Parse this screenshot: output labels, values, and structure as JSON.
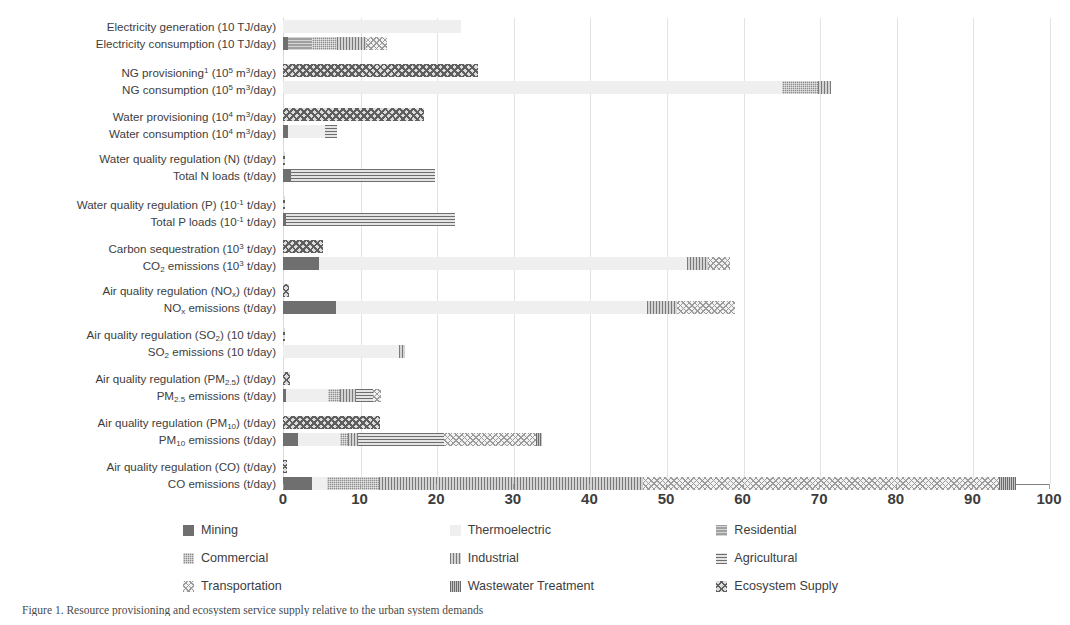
{
  "chart_data": {
    "type": "bar",
    "orientation": "horizontal",
    "title": "",
    "xlabel": "",
    "ylabel": "",
    "xlim": [
      0,
      100
    ],
    "xticks": [
      0,
      10,
      20,
      30,
      40,
      50,
      60,
      70,
      80,
      90,
      100
    ],
    "grid": true,
    "stacked": true,
    "legend_position": "bottom",
    "series": [
      {
        "name": "Mining",
        "pattern": "solid-dark",
        "color": "#6f6f6f"
      },
      {
        "name": "Thermoelectric",
        "pattern": "solid-light",
        "color": "#efefef"
      },
      {
        "name": "Residential",
        "pattern": "horizontal-fine",
        "color": "#a0a0a0"
      },
      {
        "name": "Commercial",
        "pattern": "grid-fine",
        "color": "#8e8e8e"
      },
      {
        "name": "Industrial",
        "pattern": "vertical-lines",
        "color": "#d3d3d3"
      },
      {
        "name": "Agricultural",
        "pattern": "horizontal-lines",
        "color": "#e4e4e4"
      },
      {
        "name": "Transportation",
        "pattern": "diagonal-cross-light",
        "color": "#f2f2f2"
      },
      {
        "name": "Wastewater Treatment",
        "pattern": "vertical-dense",
        "color": "#c6c6c6"
      },
      {
        "name": "Ecosystem Supply",
        "pattern": "diamond-cross",
        "color": "#dcdcdc"
      }
    ],
    "groups": [
      {
        "rows": [
          {
            "label_html": "Electricity generation (10 TJ/day)",
            "label_text": "Electricity generation (10 TJ/day)",
            "total": 23.2,
            "segments": [
              {
                "series": "Thermoelectric",
                "value": 23.2
              }
            ]
          },
          {
            "label_html": "Electricity consumption (10 TJ/day)",
            "label_text": "Electricity consumption (10 TJ/day)",
            "total": 13.6,
            "segments": [
              {
                "series": "Mining",
                "value": 0.7
              },
              {
                "series": "Residential",
                "value": 3.1
              },
              {
                "series": "Commercial",
                "value": 3.3
              },
              {
                "series": "Industrial",
                "value": 3.8
              },
              {
                "series": "Transportation",
                "value": 2.7
              }
            ]
          }
        ]
      },
      {
        "rows": [
          {
            "label_html": "NG provisioning<sup>1</sup> (10<sup>5</sup> m<sup>3</sup>/day)",
            "label_text": "NG provisioning1 (10^5 m3/day)",
            "total": 25.5,
            "segments": [
              {
                "series": "Ecosystem Supply",
                "value": 25.5
              }
            ]
          },
          {
            "label_html": "NG consumption (10<sup>5</sup> m<sup>3</sup>/day)",
            "label_text": "NG consumption (10^5 m3/day)",
            "total": 71.6,
            "segments": [
              {
                "series": "Thermoelectric",
                "value": 65.1
              },
              {
                "series": "Commercial",
                "value": 4.7
              },
              {
                "series": "Industrial",
                "value": 1.8
              }
            ]
          }
        ]
      },
      {
        "rows": [
          {
            "label_html": "Water provisioning (10<sup>4</sup> m<sup>3</sup>/day)",
            "label_text": "Water provisioning (10^4 m3/day)",
            "total": 18.4,
            "segments": [
              {
                "series": "Ecosystem Supply",
                "value": 18.4
              }
            ]
          },
          {
            "label_html": "Water consumption (10<sup>4</sup> m<sup>3</sup>/day)",
            "label_text": "Water consumption (10^4 m3/day)",
            "total": 7.0,
            "segments": [
              {
                "series": "Mining",
                "value": 0.6
              },
              {
                "series": "Thermoelectric",
                "value": 4.9
              },
              {
                "series": "Agricultural",
                "value": 1.5
              }
            ]
          }
        ]
      },
      {
        "rows": [
          {
            "label_html": "Water quality regulation (N) (t/day)",
            "label_text": "Water quality regulation (N) (t/day)",
            "total": 0.25,
            "segments": [
              {
                "series": "Ecosystem Supply",
                "value": 0.25
              }
            ]
          },
          {
            "label_html": "Total N loads (t/day)",
            "label_text": "Total N loads (t/day)",
            "total": 19.8,
            "segments": [
              {
                "series": "Mining",
                "value": 1.0
              },
              {
                "series": "Agricultural",
                "value": 18.8
              }
            ]
          }
        ]
      },
      {
        "rows": [
          {
            "label_html": "Water quality regulation (P) (10<sup>-1</sup> t/day)",
            "label_text": "Water quality regulation (P) (10^-1 t/day)",
            "total": 0.25,
            "segments": [
              {
                "series": "Ecosystem Supply",
                "value": 0.25
              }
            ]
          },
          {
            "label_html": "Total P loads (10<sup>-1</sup> t/day)",
            "label_text": "Total P loads (10^-1 t/day)",
            "total": 22.5,
            "segments": [
              {
                "series": "Mining",
                "value": 0.4
              },
              {
                "series": "Agricultural",
                "value": 22.1
              }
            ]
          }
        ]
      },
      {
        "rows": [
          {
            "label_html": "Carbon sequestration (10<sup>3</sup> t/day)",
            "label_text": "Carbon sequestration (10^3 t/day)",
            "total": 5.2,
            "segments": [
              {
                "series": "Ecosystem Supply",
                "value": 5.2
              }
            ]
          },
          {
            "label_html": "CO<sub>2</sub> emissions (10<sup>3</sup> t/day)",
            "label_text": "CO2 emissions (10^3 t/day)",
            "total": 58.3,
            "segments": [
              {
                "series": "Mining",
                "value": 4.7
              },
              {
                "series": "Thermoelectric",
                "value": 48.0
              },
              {
                "series": "Industrial",
                "value": 2.8
              },
              {
                "series": "Transportation",
                "value": 2.8
              }
            ]
          }
        ]
      },
      {
        "rows": [
          {
            "label_html": "Air quality regulation (NO<sub>x</sub>) (t/day)",
            "label_text": "Air quality regulation (NOx) (t/day)",
            "total": 0.8,
            "segments": [
              {
                "series": "Ecosystem Supply",
                "value": 0.8
              }
            ]
          },
          {
            "label_html": "NO<sub>x</sub> emissions (t/day)",
            "label_text": "NOx emissions (t/day)",
            "total": 59.0,
            "segments": [
              {
                "series": "Mining",
                "value": 6.9
              },
              {
                "series": "Thermoelectric",
                "value": 40.6
              },
              {
                "series": "Industrial",
                "value": 4.0
              },
              {
                "series": "Transportation",
                "value": 7.5
              }
            ]
          }
        ]
      },
      {
        "rows": [
          {
            "label_html": "Air quality regulation (SO<sub>2</sub>) (10 t/day)",
            "label_text": "Air quality regulation (SO2) (10 t/day)",
            "total": 0.3,
            "segments": [
              {
                "series": "Ecosystem Supply",
                "value": 0.3
              }
            ]
          },
          {
            "label_html": "SO<sub>2</sub> emissions (10 t/day)",
            "label_text": "SO2 emissions (10 t/day)",
            "total": 15.9,
            "segments": [
              {
                "series": "Thermoelectric",
                "value": 15.2
              },
              {
                "series": "Industrial",
                "value": 0.7
              }
            ]
          }
        ]
      },
      {
        "rows": [
          {
            "label_html": "Air quality regulation (PM<sub>2.5</sub>) (t/day)",
            "label_text": "Air quality regulation (PM2.5) (t/day)",
            "total": 0.9,
            "segments": [
              {
                "series": "Ecosystem Supply",
                "value": 0.9
              }
            ]
          },
          {
            "label_html": "PM<sub>2.5</sub> emissions (t/day)",
            "label_text": "PM2.5 emissions (t/day)",
            "total": 12.8,
            "segments": [
              {
                "series": "Mining",
                "value": 0.4
              },
              {
                "series": "Thermoelectric",
                "value": 5.5
              },
              {
                "series": "Commercial",
                "value": 1.5
              },
              {
                "series": "Industrial",
                "value": 2.1
              },
              {
                "series": "Agricultural",
                "value": 2.3
              },
              {
                "series": "Transportation",
                "value": 1.0
              }
            ]
          }
        ]
      },
      {
        "rows": [
          {
            "label_html": "Air quality regulation (PM<sub>10</sub>) (t/day)",
            "label_text": "Air quality regulation (PM10) (t/day)",
            "total": 12.7,
            "segments": [
              {
                "series": "Ecosystem Supply",
                "value": 12.7
              }
            ]
          },
          {
            "label_html": "PM<sub>10</sub> emissions (t/day)",
            "label_text": "PM10 emissions (t/day)",
            "total": 33.8,
            "segments": [
              {
                "series": "Mining",
                "value": 1.9
              },
              {
                "series": "Thermoelectric",
                "value": 5.6
              },
              {
                "series": "Commercial",
                "value": 1.0
              },
              {
                "series": "Industrial",
                "value": 1.3
              },
              {
                "series": "Agricultural",
                "value": 11.2
              },
              {
                "series": "Transportation",
                "value": 12.0
              },
              {
                "series": "Wastewater Treatment",
                "value": 0.8
              }
            ]
          }
        ]
      },
      {
        "rows": [
          {
            "label_html": "Air quality regulation (CO) (t/day)",
            "label_text": "Air quality regulation (CO) (t/day)",
            "total": 0.5,
            "segments": [
              {
                "series": "Ecosystem Supply",
                "value": 0.5
              }
            ]
          },
          {
            "label_html": "CO emissions (t/day)",
            "label_text": "CO emissions (t/day)",
            "total": 95.7,
            "segments": [
              {
                "series": "Mining",
                "value": 3.8
              },
              {
                "series": "Thermoelectric",
                "value": 2.0
              },
              {
                "series": "Commercial",
                "value": 6.7
              },
              {
                "series": "Industrial",
                "value": 34.5
              },
              {
                "series": "Transportation",
                "value": 46.5
              },
              {
                "series": "Wastewater Treatment",
                "value": 2.2
              }
            ]
          }
        ]
      }
    ]
  },
  "legend": {
    "rows": [
      [
        {
          "label": "Mining",
          "pattern": "p-mining"
        },
        {
          "label": "Thermoelectric",
          "pattern": "p-thermo"
        },
        {
          "label": "Residential",
          "pattern": "p-resid"
        }
      ],
      [
        {
          "label": "Commercial",
          "pattern": "p-comm"
        },
        {
          "label": "Industrial",
          "pattern": "p-indus"
        },
        {
          "label": "Agricultural",
          "pattern": "p-agri"
        }
      ],
      [
        {
          "label": "Transportation",
          "pattern": "p-transp"
        },
        {
          "label": "Wastewater Treatment",
          "pattern": "p-waste"
        },
        {
          "label": "Ecosystem Supply",
          "pattern": "p-ecos"
        }
      ]
    ]
  },
  "caption": {
    "text": "Figure 1. Resource provisioning and ecosystem service supply relative to the urban system demands"
  }
}
